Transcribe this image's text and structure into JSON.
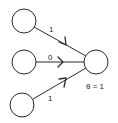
{
  "diagram": {
    "type": "threshold-logic-unit",
    "inputs": [
      {
        "id": "x1",
        "weight": "1"
      },
      {
        "id": "x2",
        "weight": "0"
      },
      {
        "id": "x3",
        "weight": "1"
      }
    ],
    "output_node": {
      "threshold_label": "θ = 1"
    }
  },
  "colors": {
    "stroke": "#2a2a2a",
    "background": "#ffffff"
  }
}
